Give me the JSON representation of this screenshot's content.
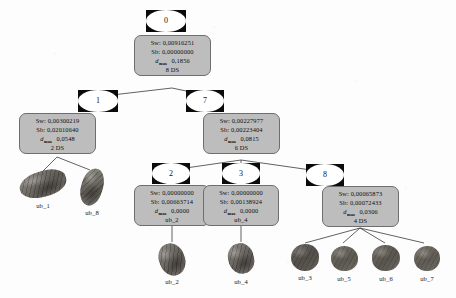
{
  "diagram": {
    "labels": {
      "sw_prefix": "Sw:",
      "sb_prefix": "Sb:",
      "dmax_symbol": "d",
      "dmax_subscript": "max",
      "ds_suffix": "DS"
    },
    "colors": {
      "box_fill": "#bdbdbd",
      "box_border": "#6e6e6e",
      "node_square": "#0b0b0b",
      "node_disc": "#ffffff",
      "edge": "#3a3a3a",
      "background": "#fdfdfd",
      "text": "#0e0e0e"
    }
  },
  "nodes": [
    {
      "id": "0",
      "sw": "Sw: 0,00916251",
      "sb": "Sb: 0,00000000",
      "dmax": "0,1856",
      "footer": "8 DS"
    },
    {
      "id": "1",
      "sw": "Sw: 0,00300219",
      "sb": "Sb: 0,02010640",
      "dmax": "0,0548",
      "footer": "2 DS"
    },
    {
      "id": "7",
      "sw": "Sw: 0,00227977",
      "sb": "Sb: 0,00223404",
      "dmax": "0,0815",
      "footer": "6 DS"
    },
    {
      "id": "2",
      "sw": "Sw: 0,00000000",
      "sb": "Sb: 0,00663714",
      "dmax": "0,0000",
      "footer": "ub_2"
    },
    {
      "id": "3",
      "sw": "Sw: 0,00000000",
      "sb": "Sb: 0,00138924",
      "dmax": "0,0000",
      "footer": "ub_4"
    },
    {
      "id": "8",
      "sw": "Sw: 0,00065873",
      "sb": "Sb: 0,00072433",
      "dmax": "0,0306",
      "footer": "4 DS"
    }
  ],
  "leaves": [
    {
      "caption": "ub_1"
    },
    {
      "caption": "ub_8"
    },
    {
      "caption": "ub_2"
    },
    {
      "caption": "ub_4"
    },
    {
      "caption": "ub_3"
    },
    {
      "caption": "ub_5"
    },
    {
      "caption": "ub_6"
    },
    {
      "caption": "ub_7"
    }
  ]
}
